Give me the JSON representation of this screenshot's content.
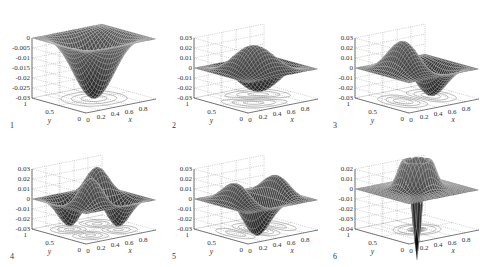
{
  "figure": {
    "layout": "2 rows x 3 columns of 3D mesh surface plots with contour projections on base plane",
    "background": "#ffffff",
    "mesh_color": "#1a1a1a",
    "grid_color": "#9a9a9a"
  },
  "chart_data": [
    {
      "type": "surface3d",
      "panel_label": "1",
      "title": "",
      "xlabel": "x",
      "ylabel": "y",
      "zlabel": "",
      "xlim": [
        0,
        1
      ],
      "ylim": [
        0,
        1
      ],
      "zlim": [
        -0.03,
        0
      ],
      "x_ticks": [
        "0",
        "0.2",
        "0.4",
        "0.6",
        "0.8"
      ],
      "y_ticks": [
        "0",
        "0.5",
        "1"
      ],
      "z_ticks": [
        "0",
        "-0.005",
        "-0.01",
        "-0.015",
        "-0.02",
        "-0.025",
        "-0.03"
      ],
      "z_tick_values": [
        0,
        -0.005,
        -0.01,
        -0.015,
        -0.02,
        -0.025,
        -0.03
      ],
      "shape": {
        "mx": 1,
        "my": 1,
        "amp": -0.03,
        "kind": "bowl"
      },
      "description": "Single central depression (minimum ≈ -0.03 at x=0.5, y=0.5), flat at 0 near edges; concentric contour rings below"
    },
    {
      "type": "surface3d",
      "panel_label": "2",
      "title": "",
      "xlabel": "x",
      "ylabel": "y",
      "zlabel": "",
      "xlim": [
        0,
        1
      ],
      "ylim": [
        0,
        1
      ],
      "zlim": [
        -0.03,
        0.03
      ],
      "x_ticks": [
        "0",
        "0.2",
        "0.4",
        "0.6",
        "0.8"
      ],
      "y_ticks": [
        "0",
        "0.5",
        "1"
      ],
      "z_ticks": [
        "0.03",
        "0.02",
        "0.01",
        "0",
        "-0.01",
        "-0.02",
        "-0.03"
      ],
      "z_tick_values": [
        0.03,
        0.02,
        0.01,
        0,
        -0.01,
        -0.02,
        -0.03
      ],
      "shape": {
        "mx": 1,
        "my": 2,
        "amp": 0.03,
        "kind": "antisym"
      },
      "description": "One positive lobe (+0.03) and one negative lobe (-0.03) along the diagonal"
    },
    {
      "type": "surface3d",
      "panel_label": "3",
      "title": "",
      "xlabel": "x",
      "ylabel": "y",
      "zlabel": "",
      "xlim": [
        0,
        1
      ],
      "ylim": [
        0,
        1
      ],
      "zlim": [
        -0.03,
        0.03
      ],
      "x_ticks": [
        "0",
        "0.2",
        "0.4",
        "0.6",
        "0.8"
      ],
      "y_ticks": [
        "0",
        "0.5",
        "1"
      ],
      "z_ticks": [
        "0.03",
        "0.02",
        "0.01",
        "0",
        "-0.01",
        "-0.02",
        "-0.03"
      ],
      "z_tick_values": [
        0.03,
        0.02,
        0.01,
        0,
        -0.01,
        -0.02,
        -0.03
      ],
      "shape": {
        "mx": 2,
        "my": 1,
        "amp": 0.03,
        "kind": "antisym"
      },
      "description": "Two lobes of opposite sign (saddle-like), peaks ≈ ±0.03; two contour ovals below"
    },
    {
      "type": "surface3d",
      "panel_label": "4",
      "title": "",
      "xlabel": "x",
      "ylabel": "y",
      "zlabel": "",
      "xlim": [
        0,
        1
      ],
      "ylim": [
        0,
        1
      ],
      "zlim": [
        -0.03,
        0.03
      ],
      "x_ticks": [
        "0",
        "0.2",
        "0.4",
        "0.6",
        "0.8"
      ],
      "y_ticks": [
        "0",
        "0.5",
        "1"
      ],
      "z_ticks": [
        "0.03",
        "0.02",
        "0.01",
        "0",
        "-0.01",
        "-0.02",
        "-0.03"
      ],
      "z_tick_values": [
        0.03,
        0.02,
        0.01,
        0,
        -0.01,
        -0.02,
        -0.03
      ],
      "shape": {
        "mx": 2,
        "my": 2,
        "amp": 0.03,
        "kind": "quad"
      },
      "description": "Four lobes: two positive peaks (+0.03) and two negative troughs (-0.03) in checkerboard arrangement"
    },
    {
      "type": "surface3d",
      "panel_label": "5",
      "title": "",
      "xlabel": "x",
      "ylabel": "y",
      "zlabel": "",
      "xlim": [
        0,
        1
      ],
      "ylim": [
        0,
        1
      ],
      "zlim": [
        -0.03,
        0.03
      ],
      "x_ticks": [
        "0",
        "0.2",
        "0.4",
        "0.6",
        "0.8"
      ],
      "y_ticks": [
        "0",
        "0.5",
        "1"
      ],
      "z_ticks": [
        "0.03",
        "0.02",
        "0.01",
        "0",
        "-0.01",
        "-0.02",
        "-0.03"
      ],
      "z_tick_values": [
        0.03,
        0.02,
        0.01,
        0,
        -0.01,
        -0.02,
        -0.03
      ],
      "shape": {
        "mx": 3,
        "my": 1,
        "amp": 0.03,
        "kind": "tri"
      },
      "description": "Three alternating lobes, peak ≈ +0.03 and troughs ≈ -0.02 to -0.03; three contour ovals below"
    },
    {
      "type": "surface3d",
      "panel_label": "6",
      "title": "",
      "xlabel": "x",
      "ylabel": "y",
      "zlabel": "",
      "xlim": [
        0,
        1
      ],
      "ylim": [
        0,
        1
      ],
      "zlim": [
        -0.04,
        0.02
      ],
      "x_ticks": [
        "0",
        "0.2",
        "0.4",
        "0.6",
        "0.8"
      ],
      "y_ticks": [
        "0",
        "0.5",
        "1"
      ],
      "z_ticks": [
        "0.02",
        "0.01",
        "0",
        "-0.01",
        "-0.02",
        "-0.03",
        "-0.04"
      ],
      "z_tick_values": [
        0.02,
        0.01,
        0,
        -0.01,
        -0.02,
        -0.03,
        -0.04
      ],
      "shape": {
        "mx": 1,
        "my": 1,
        "amp": -0.035,
        "kind": "ring"
      },
      "description": "Axisymmetric: central sharp depression (≈ -0.035) surrounded by raised ring (≈ +0.02); multiple concentric contour rings below"
    }
  ],
  "panel_positions": [
    {
      "left": 0,
      "top": 0
    },
    {
      "left": 162,
      "top": 0
    },
    {
      "left": 323,
      "top": 0
    },
    {
      "left": 0,
      "top": 131
    },
    {
      "left": 162,
      "top": 131
    },
    {
      "left": 323,
      "top": 131
    }
  ]
}
